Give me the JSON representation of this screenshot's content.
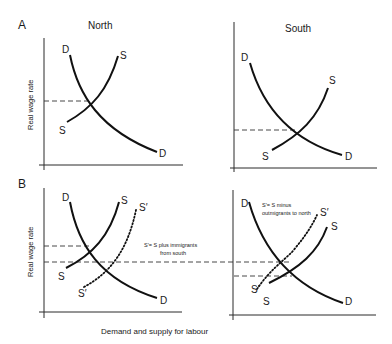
{
  "figure": {
    "x_axis_title": "Demand and supply for labour",
    "panels": [
      {
        "id": "A",
        "label": "A",
        "y_axis_title": "Real wage rate",
        "regions": [
          {
            "title": "North",
            "curves": {
              "demand": "D",
              "demand_end": "D",
              "supply": "S",
              "supply_end": "S"
            }
          },
          {
            "title": "South",
            "curves": {
              "demand": "D",
              "demand_end": "D",
              "supply": "S",
              "supply_end": "S"
            }
          }
        ]
      },
      {
        "id": "B",
        "label": "B",
        "y_axis_title": "Real wage rate",
        "regions": [
          {
            "title": "",
            "curves": {
              "demand": "D",
              "demand_end": "D",
              "supply": "S",
              "supply_end": "S",
              "shifted_supply": "S′",
              "shifted_supply_end": "S′"
            },
            "note_line1": "S′= S plus immigrants",
            "note_line2": "from south"
          },
          {
            "title": "",
            "curves": {
              "demand": "D",
              "demand_end": "D",
              "supply": "S",
              "supply_end": "S",
              "shifted_supply": "S′",
              "shifted_supply_end": "S′"
            },
            "note_line1": "S′= S minus",
            "note_line2": "outmigrants to north"
          }
        ]
      }
    ]
  }
}
